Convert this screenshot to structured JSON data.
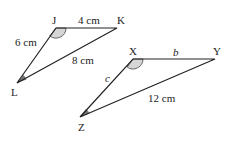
{
  "diagram": {
    "triangle_1": {
      "vertices": {
        "J": "J",
        "K": "K",
        "L": "L"
      },
      "sides": {
        "JK": "4 cm",
        "JL": "6 cm",
        "KL": "8 cm"
      }
    },
    "triangle_2": {
      "vertices": {
        "X": "X",
        "Y": "Y",
        "Z": "Z"
      },
      "sides": {
        "XY": "b",
        "XZ": "c",
        "YZ": "12 cm"
      }
    },
    "colors": {
      "line": "#222222",
      "angle_light": "#d6d6d6",
      "angle_dark": "#777777"
    }
  }
}
